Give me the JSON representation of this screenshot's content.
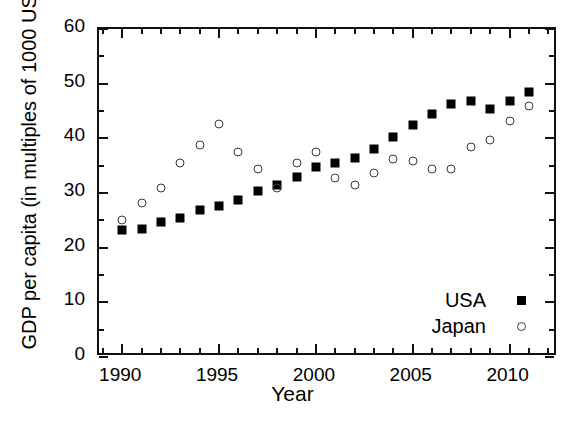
{
  "chart_data": {
    "type": "scatter",
    "title": "",
    "xlabel": "Year",
    "ylabel": "GDP per capita (in multiples of 1000 USD)",
    "xlim": [
      1988.8,
      2012.5
    ],
    "ylim": [
      0,
      60
    ],
    "xticks": [
      1990,
      1995,
      2000,
      2005,
      2010
    ],
    "xtick_labels": [
      "1990",
      "1995",
      "2000",
      "2005",
      "2010"
    ],
    "xtick_minor_step": 1,
    "yticks": [
      0,
      10,
      20,
      30,
      40,
      50,
      60
    ],
    "ytick_labels": [
      "0",
      "10",
      "20",
      "30",
      "40",
      "50",
      "60"
    ],
    "grid": false,
    "legend_position": "lower-right-inside",
    "x": [
      1990,
      1991,
      1992,
      1993,
      1994,
      1995,
      1996,
      1997,
      1998,
      1999,
      2000,
      2001,
      2002,
      2003,
      2004,
      2005,
      2006,
      2007,
      2008,
      2009,
      2010,
      2011
    ],
    "series": [
      {
        "name": "USA",
        "marker": "filled-square",
        "color": "#000000",
        "values": [
          23.2,
          23.5,
          24.7,
          25.5,
          26.9,
          27.6,
          28.8,
          30.3,
          31.5,
          33.0,
          34.8,
          35.5,
          36.4,
          38.1,
          40.2,
          42.5,
          44.5,
          46.2,
          46.9,
          45.3,
          46.9,
          48.5
        ]
      },
      {
        "name": "Japan",
        "marker": "open-circle",
        "color": "#3a3a3a",
        "values": [
          25.1,
          28.2,
          31.0,
          35.4,
          38.8,
          42.6,
          37.5,
          34.4,
          31.0,
          35.5,
          37.5,
          32.7,
          31.4,
          33.6,
          36.3,
          35.8,
          34.4,
          34.4,
          38.4,
          39.7,
          43.1,
          46.0
        ]
      }
    ]
  },
  "legend": {
    "items": [
      {
        "label": "USA",
        "marker": "filled-square"
      },
      {
        "label": "Japan",
        "marker": "open-circle"
      }
    ]
  }
}
